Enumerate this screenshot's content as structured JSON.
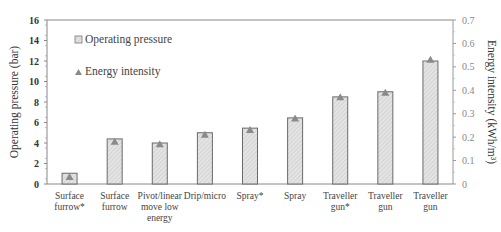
{
  "chart_data": {
    "type": "bar",
    "title": "",
    "xlabel": "",
    "ylabel": "Operating pressure (bar)",
    "y2label": "Energy intensity (kWh/m³)",
    "ylim": [
      0,
      16
    ],
    "y2lim": [
      0,
      0.7
    ],
    "yticks": [
      0,
      2,
      4,
      6,
      8,
      10,
      12,
      14,
      16
    ],
    "y2ticks": [
      0,
      0.1,
      0.2,
      0.3,
      0.4,
      0.5,
      0.6,
      0.7
    ],
    "grid": false,
    "legend_position": "upper-left inside",
    "categories": [
      [
        "Surface",
        "furrow*"
      ],
      [
        "Surface",
        "furrow"
      ],
      [
        "Pivot/linear",
        "move low",
        "energy"
      ],
      [
        "Drip/micro"
      ],
      [
        "Spray*"
      ],
      [
        "Spray"
      ],
      [
        "Traveller",
        "gun*"
      ],
      [
        "Traveller",
        "gun"
      ],
      [
        "Traveller",
        "gun"
      ]
    ],
    "series": [
      {
        "name": "Operating pressure",
        "type": "bar",
        "axis": "left",
        "values": [
          1.05,
          4.4,
          4.0,
          5.0,
          5.45,
          6.45,
          8.5,
          9.0,
          12.0
        ]
      },
      {
        "name": "Energy intensity",
        "type": "marker-triangle",
        "axis": "right",
        "values": [
          0.03,
          0.18,
          0.17,
          0.21,
          0.23,
          0.28,
          0.37,
          0.39,
          0.53
        ]
      }
    ],
    "colors": {
      "bar_fill": "#e3e3e3",
      "bar_stroke": "#6a6a6a",
      "hatch": "#bdbdbd",
      "triangle": "#8a8a8a",
      "axis": "#888888"
    }
  },
  "legend": {
    "items": [
      {
        "label": "Operating pressure",
        "icon": "hatched-square-icon"
      },
      {
        "label": "Energy intensity",
        "icon": "triangle-icon"
      }
    ]
  }
}
